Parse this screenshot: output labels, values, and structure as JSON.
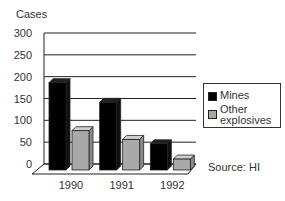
{
  "chart_data": {
    "type": "bar",
    "title": "",
    "xlabel": "",
    "ylabel": "Cases",
    "categories": [
      "1990",
      "1991",
      "1992"
    ],
    "series": [
      {
        "name": "Mines",
        "color": "#000000",
        "values": [
          200,
          155,
          60
        ]
      },
      {
        "name": "Other explosives",
        "color": "#a9a9a9",
        "values": [
          90,
          70,
          25
        ]
      }
    ],
    "ylim": [
      0,
      300
    ],
    "yticks": [
      "0",
      "50",
      "100",
      "150",
      "200",
      "250",
      "300"
    ],
    "grid": true,
    "legend_position": "right",
    "style": "3d",
    "annotation": "Source: HI"
  },
  "legend": {
    "mines": "Mines",
    "other_line1": "Other",
    "other_line2": "explosives"
  },
  "source": "Source: HI",
  "ylabel": "Cases"
}
